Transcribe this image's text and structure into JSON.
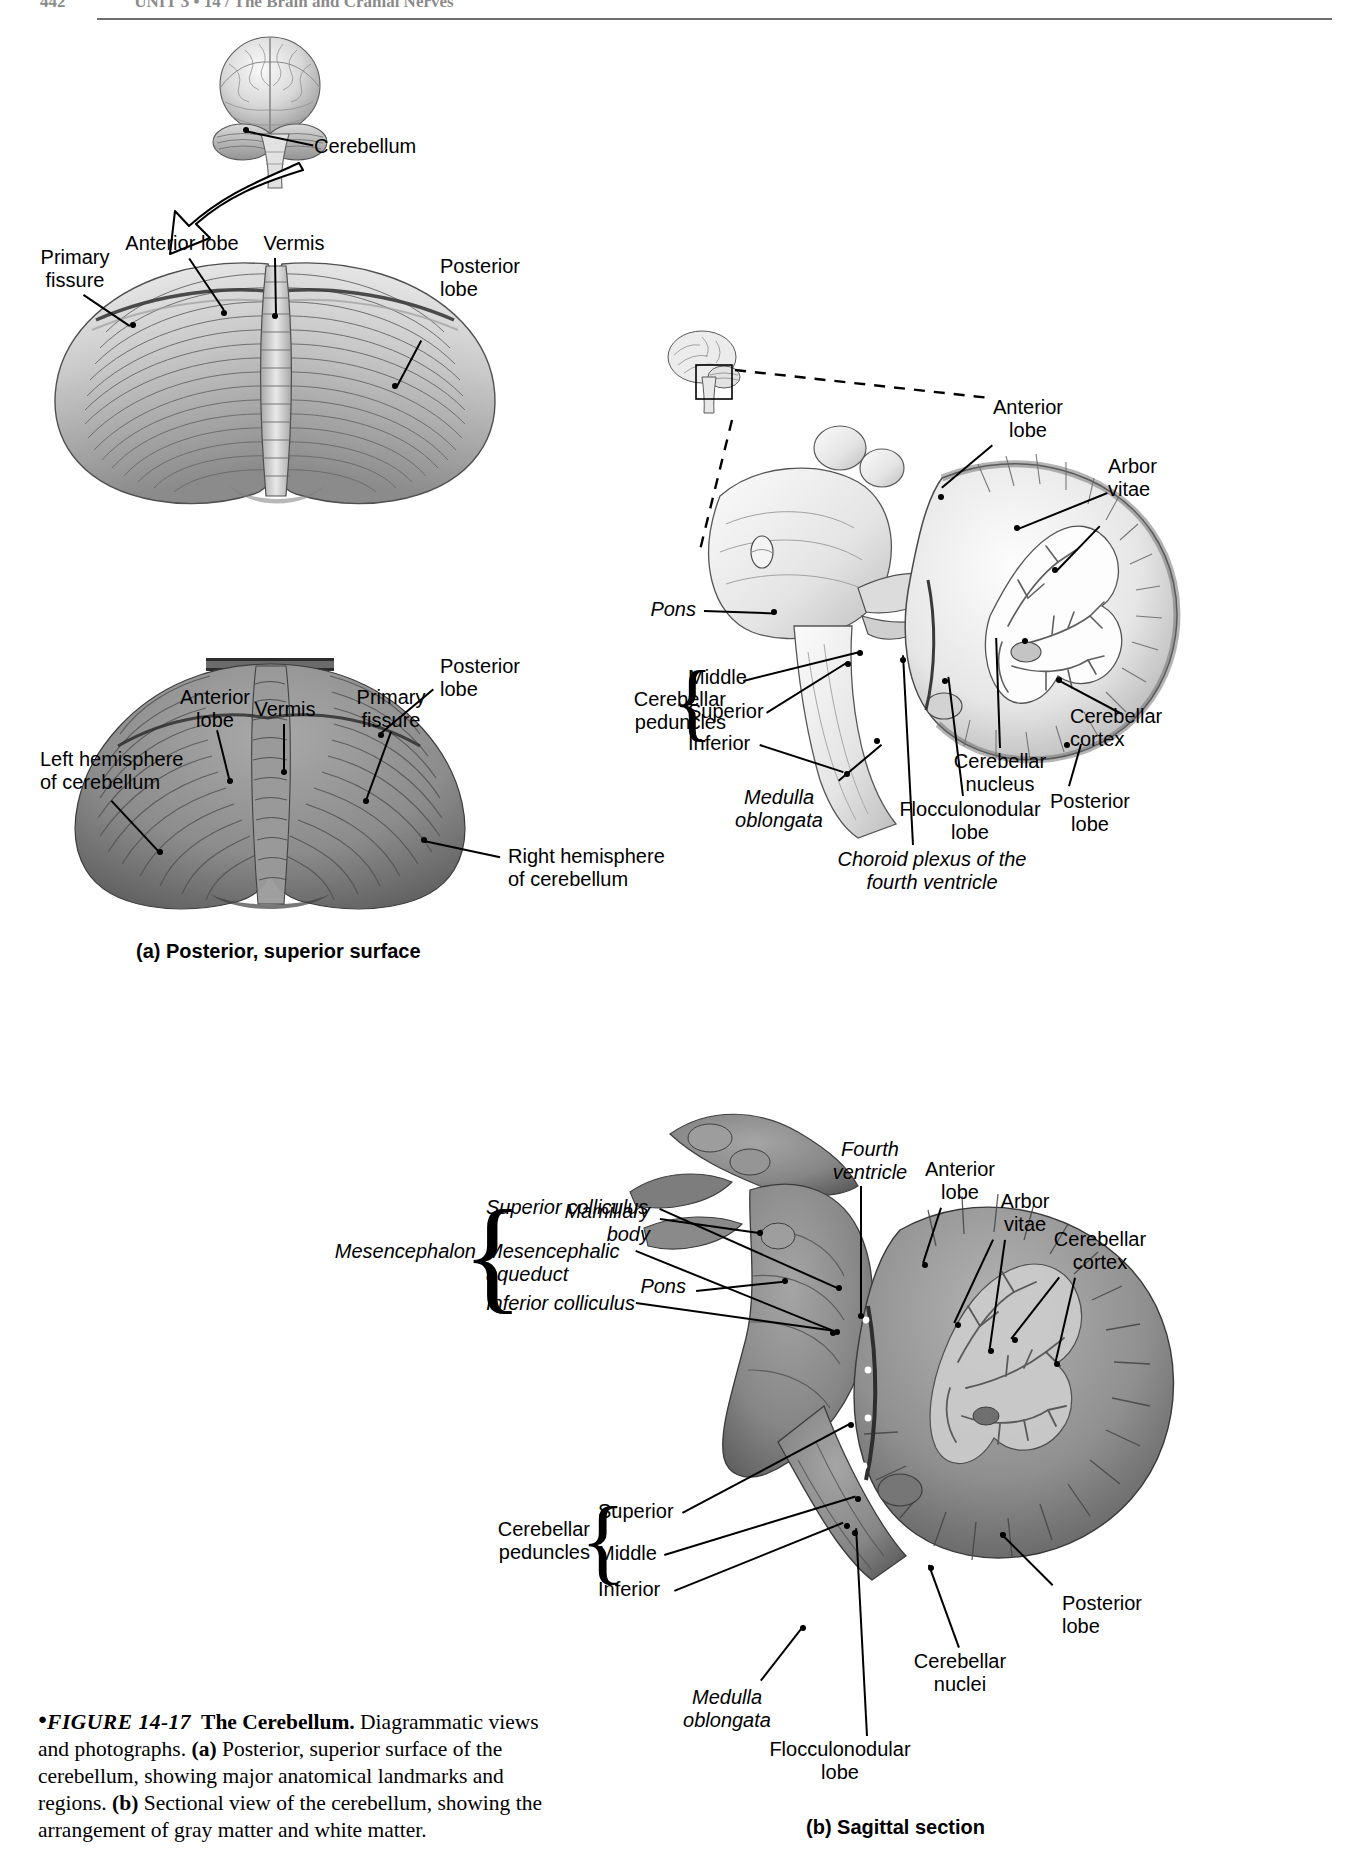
{
  "runhead": {
    "folio": "442",
    "text": "UNIT 3  •  14 / The Brain and Cranial Nerves"
  },
  "figure": {
    "bullet": "●",
    "number": "FIGURE 14-17",
    "title": "The Cerebellum.",
    "body_1": " Diagrammatic views and photographs. ",
    "a_tag": "(a)",
    "body_2": " Posterior, superior surface of the cerebellum, showing major anatomical landmarks and regions. ",
    "b_tag": "(b)",
    "body_3": " Sectional view of the cerebellum, showing the arrangement of gray matter and white matter."
  },
  "panel_titles": {
    "a": "(a) Posterior, superior surface",
    "b": "(b) Sagittal section"
  },
  "orientation": {
    "cerebellum_label": "Cerebellum"
  },
  "diagram_superior": {
    "labels": [
      {
        "id": "primary-fissure",
        "text": "Primary\nfissure",
        "italic": false
      },
      {
        "id": "anterior-lobe",
        "text": "Anterior lobe",
        "italic": false
      },
      {
        "id": "vermis",
        "text": "Vermis",
        "italic": false
      },
      {
        "id": "posterior-lobe",
        "text": "Posterior\nlobe",
        "italic": false
      }
    ]
  },
  "photo_superior": {
    "labels": [
      {
        "id": "anterior-lobe",
        "text": "Anterior\nlobe",
        "italic": false
      },
      {
        "id": "vermis",
        "text": "Vermis",
        "italic": false
      },
      {
        "id": "primary-fissure",
        "text": "Primary\nfissure",
        "italic": false
      },
      {
        "id": "left-hemisphere",
        "text": "Left hemisphere\nof cerebellum",
        "italic": false
      },
      {
        "id": "posterior-lobe",
        "text": "Posterior\nlobe",
        "italic": false
      },
      {
        "id": "right-hemisphere",
        "text": "Right hemisphere\nof cerebellum",
        "italic": false
      }
    ]
  },
  "diagram_sagittal": {
    "labels": [
      {
        "id": "anterior-lobe",
        "text": "Anterior\nlobe",
        "italic": false
      },
      {
        "id": "arbor-vitae",
        "text": "Arbor\nvitae",
        "italic": false
      },
      {
        "id": "cerebellar-cortex",
        "text": "Cerebellar\ncortex",
        "italic": false
      },
      {
        "id": "posterior-lobe",
        "text": "Posterior\nlobe",
        "italic": false
      },
      {
        "id": "cerebellar-nucleus",
        "text": "Cerebellar\nnucleus",
        "italic": false
      },
      {
        "id": "flocculonodular-lobe",
        "text": "Flocculonodular\nlobe",
        "italic": false
      },
      {
        "id": "pons",
        "text": "Pons",
        "italic": true
      },
      {
        "id": "medulla-oblongata",
        "text": "Medulla\noblongata",
        "italic": true
      },
      {
        "id": "choroid-plexus",
        "text": "Choroid plexus of the\nfourth ventricle",
        "italic": true
      }
    ],
    "peduncles_group": {
      "title": "Cerebellar\npeduncles",
      "items": [
        "Middle",
        "Superior",
        "Inferior"
      ]
    }
  },
  "photo_sagittal": {
    "mesencephalon_group": {
      "title": "Mesencephalon",
      "items": [
        {
          "id": "superior-colliculus",
          "text": "Superior colliculus"
        },
        {
          "id": "mesencephalic-aqueduct",
          "text": "Mesencephalic\naqueduct"
        },
        {
          "id": "inferior-colliculus",
          "text": "Inferior colliculus"
        }
      ]
    },
    "peduncles_group": {
      "title": "Cerebellar\npeduncles",
      "items": [
        "Superior",
        "Middle",
        "Inferior"
      ]
    },
    "labels": [
      {
        "id": "fourth-ventricle",
        "text": "Fourth\nventricle",
        "italic": true
      },
      {
        "id": "anterior-lobe",
        "text": "Anterior\nlobe",
        "italic": false
      },
      {
        "id": "arbor-vitae",
        "text": "Arbor\nvitae",
        "italic": false
      },
      {
        "id": "cerebellar-cortex",
        "text": "Cerebellar\ncortex",
        "italic": false
      },
      {
        "id": "posterior-lobe",
        "text": "Posterior\nlobe",
        "italic": false
      },
      {
        "id": "cerebellar-nuclei",
        "text": "Cerebellar\nnuclei",
        "italic": false
      },
      {
        "id": "flocculonodular-lobe",
        "text": "Flocculonodular\nlobe",
        "italic": false
      },
      {
        "id": "mamillary-body",
        "text": "Mamillary\nbody",
        "italic": true
      },
      {
        "id": "pons",
        "text": "Pons",
        "italic": true
      },
      {
        "id": "medulla-oblongata",
        "text": "Medulla\noblongata",
        "italic": true
      }
    ]
  },
  "colors": {
    "ink": "#000000",
    "page": "#ffffff",
    "photo_gray": "#8d8d8d",
    "art_light": "#f0f0f0",
    "art_mid": "#bdbdbd",
    "art_dark": "#6f6f6f"
  }
}
